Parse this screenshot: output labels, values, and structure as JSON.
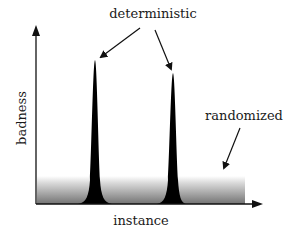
{
  "diagram": {
    "axes": {
      "y_label": "badness",
      "x_label": "instance"
    },
    "annotations": {
      "deterministic": "deterministic",
      "randomized": "randomized"
    },
    "series": [
      {
        "name": "deterministic",
        "shape": "two sharp peaks",
        "peaks": [
          {
            "x_center": 95,
            "top_y": 60
          },
          {
            "x_center": 173,
            "top_y": 73
          }
        ],
        "color": "#000000"
      },
      {
        "name": "randomized",
        "shape": "low flat band",
        "color_top": "#ffffff",
        "color_bottom": "#808080"
      }
    ],
    "colors": {
      "axis": "#111111",
      "peak_fill": "#000000",
      "band_top": "#f4f4f4",
      "band_bottom": "#7a7a7a",
      "text": "#1a1a1a"
    }
  }
}
